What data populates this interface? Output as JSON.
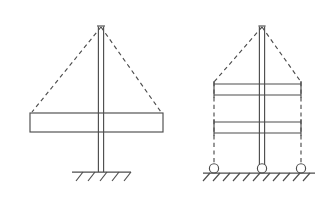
{
  "figure": {
    "background_color": "#ffffff",
    "line_color": "#4d4d4d",
    "width": 331,
    "height": 204,
    "diagrams": [
      {
        "id": "left-diagram",
        "name": "fixed-base-cantilever-column",
        "description": "Single column with one transverse beam on a fixed base support",
        "column": {
          "name": "vertical-column",
          "x_center": 101,
          "top_y": 24,
          "bottom_y": 172,
          "web_half_width": 2.6,
          "cap_half_width": 4.0,
          "cap_y": 26.5
        },
        "beams": [
          {
            "name": "transverse-beam",
            "x_left": 30,
            "x_right": 163,
            "y_top": 113,
            "y_bottom": 132
          }
        ],
        "deflected_shape": {
          "name": "deflected-shape-dashed",
          "apex_x": 101,
          "apex_y": 27,
          "left_x": 32,
          "left_y": 112,
          "right_x": 161,
          "right_y": 112
        },
        "support": {
          "type": "fixed",
          "name": "fixed-support",
          "ground_y": 172,
          "x_left": 72,
          "x_right": 131,
          "hatch_count": 5,
          "hatch_length": 9,
          "hatch_spacing": 12
        }
      },
      {
        "id": "right-diagram",
        "name": "pinned-base-two-story-frame",
        "description": "Column with two transverse beams on three roller supports",
        "column": {
          "name": "vertical-column",
          "x_center": 262,
          "top_y": 24,
          "bottom_y": 168,
          "web_half_width": 2.6,
          "cap_half_width": 3.6,
          "cap_y": 26.5
        },
        "beams": [
          {
            "name": "upper-transverse-beam",
            "x_left": 214,
            "x_right": 301,
            "y_top": 84,
            "y_bottom": 95,
            "end_cap_top": 81,
            "end_cap_bottom": 98
          },
          {
            "name": "lower-transverse-beam",
            "x_left": 214,
            "x_right": 301,
            "y_top": 122,
            "y_bottom": 133,
            "end_cap_top": 119,
            "end_cap_bottom": 136
          }
        ],
        "deflected_shape": {
          "name": "deflected-shape-dashed",
          "apex_x": 262,
          "apex_y": 27,
          "left_x": 214,
          "left_y": 82,
          "right_x": 301,
          "right_y": 82,
          "left_vertical_bottom_y": 166,
          "right_vertical_bottom_y": 166
        },
        "supports": {
          "type": "roller",
          "name": "roller-supports",
          "ground_y": 173,
          "circle_radius": 4.6,
          "circle_centers_x": [
            214,
            262,
            301
          ],
          "ground_x_left": 203,
          "ground_x_right": 315,
          "hatch_count": 11,
          "hatch_length": 8,
          "hatch_spacing": 10
        }
      }
    ]
  }
}
